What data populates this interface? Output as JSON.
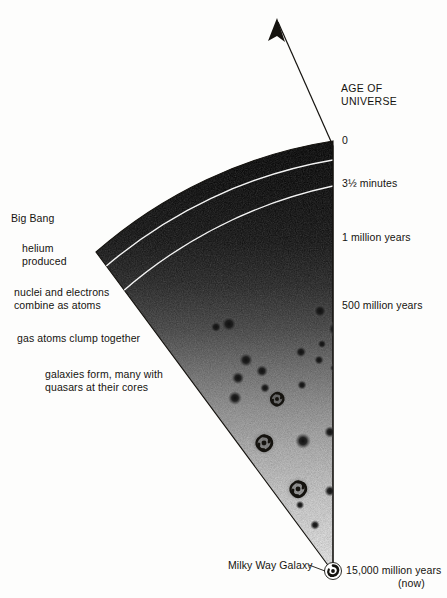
{
  "figure": {
    "type": "cosmology-timeline-cone",
    "background_color": "#fdfdfc",
    "ink_color": "#15130f"
  },
  "axis": {
    "header": "AGE OF\nUNIVERSE",
    "arrow_label": "",
    "ticks": [
      {
        "label": "0",
        "y": 141
      },
      {
        "label": "3½ minutes",
        "y": 184
      },
      {
        "label": "1 million years",
        "y": 238
      },
      {
        "label": "500 million years",
        "y": 306
      },
      {
        "label": "15,000 million years",
        "y": 571
      },
      {
        "label": "(now)",
        "y": 584
      }
    ]
  },
  "events": [
    {
      "label": "Big Bang",
      "x": 11,
      "y": 218
    },
    {
      "label": "helium\nproduced",
      "x": 22,
      "y": 248
    },
    {
      "label": "nuclei and electrons\ncombine as atoms",
      "x": 14,
      "y": 292
    },
    {
      "label": "gas atoms clump together",
      "x": 17,
      "y": 338
    },
    {
      "label": "galaxies form, many with\nquasars at their cores",
      "x": 45,
      "y": 374
    }
  ],
  "apex": {
    "label": "Milky Way Galaxy",
    "x": 228,
    "y": 565
  },
  "chart_data": {
    "type": "area",
    "xlabel": "",
    "ylabel": "AGE OF UNIVERSE",
    "categories": [
      "0",
      "3½ minutes",
      "1 million years",
      "500 million years",
      "15,000 million years"
    ],
    "values": [
      0,
      2.3e-10,
      6.7e-05,
      0.033,
      1.0
    ],
    "annotations": [
      "Big Bang",
      "helium produced",
      "nuclei and electrons combine as atoms",
      "gas atoms clump together",
      "galaxies form, many with quasars at their cores",
      "Milky Way Galaxy"
    ],
    "grid": false,
    "legend": "none"
  },
  "galaxies": {
    "blobs": [
      {
        "x": 229,
        "y": 324,
        "r": 5.5
      },
      {
        "x": 320,
        "y": 311,
        "r": 4.8
      },
      {
        "x": 335,
        "y": 329,
        "r": 5.2
      },
      {
        "x": 322,
        "y": 344,
        "r": 3.2
      },
      {
        "x": 216,
        "y": 327,
        "r": 4.0
      },
      {
        "x": 246,
        "y": 360,
        "r": 5.0
      },
      {
        "x": 262,
        "y": 371,
        "r": 4.4
      },
      {
        "x": 238,
        "y": 378,
        "r": 4.6
      },
      {
        "x": 265,
        "y": 388,
        "r": 3.6
      },
      {
        "x": 301,
        "y": 352,
        "r": 4.0
      },
      {
        "x": 319,
        "y": 360,
        "r": 3.5
      },
      {
        "x": 334,
        "y": 368,
        "r": 3.0
      },
      {
        "x": 235,
        "y": 398,
        "r": 5.0
      },
      {
        "x": 302,
        "y": 385,
        "r": 3.4
      },
      {
        "x": 303,
        "y": 441,
        "r": 5.6
      },
      {
        "x": 330,
        "y": 432,
        "r": 4.2
      },
      {
        "x": 241,
        "y": 478,
        "r": 5.2
      },
      {
        "x": 330,
        "y": 491,
        "r": 4.0
      },
      {
        "x": 315,
        "y": 525,
        "r": 3.4
      },
      {
        "x": 300,
        "y": 505,
        "r": 3.0
      }
    ],
    "spirals": [
      {
        "x": 277,
        "y": 399,
        "r": 9
      },
      {
        "x": 264,
        "y": 443,
        "r": 11
      },
      {
        "x": 298,
        "y": 489,
        "r": 11
      },
      {
        "x": 333,
        "y": 571,
        "r": 8
      }
    ]
  }
}
